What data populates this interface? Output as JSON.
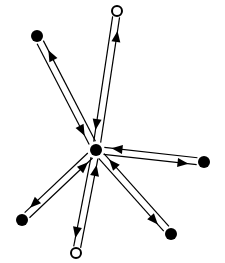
{
  "diagram": {
    "type": "star-graph",
    "background": "#ffffff",
    "stroke_color": "#000000",
    "center": {
      "id": "hub",
      "x": 96,
      "y": 150,
      "r": 6,
      "style": "filled"
    },
    "nodes": [
      {
        "id": "top-left",
        "x": 37,
        "y": 36,
        "r": 6,
        "style": "filled"
      },
      {
        "id": "top",
        "x": 117,
        "y": 11,
        "r": 5,
        "style": "hollow"
      },
      {
        "id": "right",
        "x": 204,
        "y": 162,
        "r": 6,
        "style": "filled"
      },
      {
        "id": "bottom-right",
        "x": 171,
        "y": 234,
        "r": 6,
        "style": "filled"
      },
      {
        "id": "bottom",
        "x": 76,
        "y": 253,
        "r": 5,
        "style": "hollow"
      },
      {
        "id": "bottom-left",
        "x": 22,
        "y": 220,
        "r": 6,
        "style": "filled"
      }
    ],
    "edges": [
      {
        "node": "top-left",
        "bidirectional": true
      },
      {
        "node": "top",
        "bidirectional": true
      },
      {
        "node": "right",
        "bidirectional": true
      },
      {
        "node": "bottom-right",
        "bidirectional": true
      },
      {
        "node": "bottom",
        "bidirectional": true
      },
      {
        "node": "bottom-left",
        "bidirectional": true
      }
    ]
  }
}
